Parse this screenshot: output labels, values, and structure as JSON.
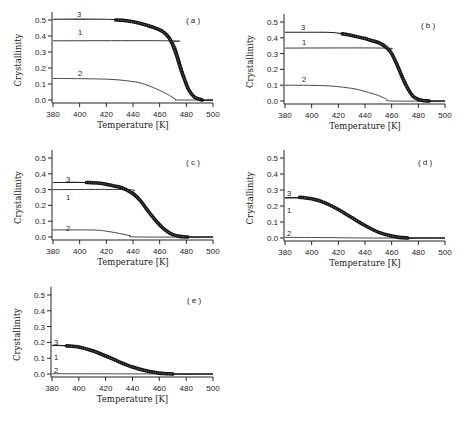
{
  "figure": {
    "xlabel": "Temperature [K]",
    "ylabel": "Crystallinity",
    "xticks": [
      "380",
      "400",
      "420",
      "440",
      "460",
      "480",
      "500"
    ],
    "yticks": [
      "0.0",
      "0.1",
      "0.2",
      "0.3",
      "0.4",
      "0.5"
    ]
  },
  "chart_data": [
    {
      "panel": "(a)",
      "type": "line",
      "xlabel": "Temperature [K]",
      "ylabel": "Crystallinity",
      "xlim": [
        380,
        500
      ],
      "ylim": [
        0,
        0.5
      ],
      "grid": false,
      "series": [
        {
          "name": "1",
          "x": [
            380,
            468,
            470,
            472,
            474,
            476,
            478,
            480,
            482,
            484,
            486,
            490,
            500
          ],
          "values": [
            0.37,
            0.37,
            0.36,
            0.33,
            0.28,
            0.22,
            0.16,
            0.1,
            0.06,
            0.03,
            0.01,
            0.0,
            0.0
          ]
        },
        {
          "name": "2",
          "x": [
            380,
            420,
            440,
            450,
            460,
            466,
            472,
            474,
            500
          ],
          "values": [
            0.135,
            0.13,
            0.115,
            0.095,
            0.06,
            0.035,
            0.005,
            0.0,
            0.0
          ]
        },
        {
          "name": "3",
          "x": [
            380,
            420,
            430,
            440,
            450,
            460,
            466,
            470,
            474,
            478,
            482,
            486,
            490,
            500
          ],
          "values": [
            0.505,
            0.505,
            0.5,
            0.485,
            0.465,
            0.435,
            0.4,
            0.35,
            0.27,
            0.16,
            0.07,
            0.02,
            0.0,
            0.0
          ]
        },
        {
          "name": "data",
          "style": "markers",
          "x": [
            427,
            435,
            445,
            455,
            462,
            467,
            470,
            473,
            476,
            479,
            482,
            486,
            490,
            492
          ],
          "values": [
            0.5,
            0.495,
            0.48,
            0.455,
            0.43,
            0.39,
            0.34,
            0.27,
            0.19,
            0.12,
            0.06,
            0.02,
            0.005,
            0.0
          ]
        }
      ]
    },
    {
      "panel": "(b)",
      "type": "line",
      "xlabel": "Temperature [K]",
      "ylabel": "Crystallinity",
      "xlim": [
        380,
        500
      ],
      "ylim": [
        0,
        0.5
      ],
      "grid": false,
      "series": [
        {
          "name": "1",
          "x": [
            380,
            454,
            458,
            462,
            466,
            470,
            474,
            478,
            482,
            500
          ],
          "values": [
            0.335,
            0.335,
            0.32,
            0.27,
            0.19,
            0.11,
            0.05,
            0.015,
            0.0,
            0.0
          ]
        },
        {
          "name": "2",
          "x": [
            380,
            410,
            430,
            440,
            450,
            456,
            460,
            500
          ],
          "values": [
            0.1,
            0.097,
            0.08,
            0.06,
            0.035,
            0.012,
            0.0,
            0.0
          ]
        },
        {
          "name": "3",
          "x": [
            380,
            410,
            420,
            430,
            440,
            450,
            456,
            460,
            464,
            468,
            472,
            476,
            480,
            488,
            500
          ],
          "values": [
            0.435,
            0.435,
            0.43,
            0.415,
            0.395,
            0.37,
            0.34,
            0.3,
            0.23,
            0.15,
            0.08,
            0.03,
            0.01,
            0.0,
            0.0
          ]
        },
        {
          "name": "data",
          "style": "markers",
          "x": [
            423,
            430,
            440,
            450,
            456,
            460,
            464,
            468,
            472,
            476,
            480,
            484,
            488
          ],
          "values": [
            0.425,
            0.415,
            0.395,
            0.37,
            0.34,
            0.3,
            0.23,
            0.15,
            0.08,
            0.03,
            0.01,
            0.002,
            0.0
          ]
        }
      ]
    },
    {
      "panel": "(c)",
      "type": "line",
      "xlabel": "Temperature [K]",
      "ylabel": "Crystallinity",
      "xlim": [
        380,
        500
      ],
      "ylim": [
        0,
        0.5
      ],
      "grid": false,
      "series": [
        {
          "name": "1",
          "x": [
            380,
            436,
            440,
            444,
            448,
            452,
            456,
            460,
            466,
            472,
            478,
            500
          ],
          "values": [
            0.3,
            0.3,
            0.285,
            0.255,
            0.21,
            0.16,
            0.11,
            0.07,
            0.03,
            0.01,
            0.0,
            0.0
          ]
        },
        {
          "name": "2",
          "x": [
            380,
            410,
            420,
            430,
            438,
            443,
            500
          ],
          "values": [
            0.045,
            0.044,
            0.037,
            0.022,
            0.008,
            0.0,
            0.0
          ]
        },
        {
          "name": "3",
          "x": [
            380,
            405,
            420,
            430,
            436,
            440,
            444,
            448,
            452,
            456,
            460,
            466,
            472,
            478,
            500
          ],
          "values": [
            0.345,
            0.345,
            0.335,
            0.315,
            0.295,
            0.275,
            0.245,
            0.205,
            0.16,
            0.11,
            0.07,
            0.03,
            0.01,
            0.0,
            0.0
          ]
        },
        {
          "name": "data",
          "style": "markers",
          "x": [
            405,
            415,
            425,
            432,
            438,
            442,
            446,
            450,
            454,
            458,
            462,
            466,
            470,
            474,
            478,
            481
          ],
          "values": [
            0.345,
            0.34,
            0.325,
            0.31,
            0.285,
            0.26,
            0.225,
            0.18,
            0.135,
            0.095,
            0.06,
            0.033,
            0.015,
            0.006,
            0.001,
            0.0
          ]
        }
      ]
    },
    {
      "panel": "(d)",
      "type": "line",
      "xlabel": "Temperature [K]",
      "ylabel": "Crystallinity",
      "xlim": [
        380,
        500
      ],
      "ylim": [
        0,
        0.5
      ],
      "grid": false,
      "series": [
        {
          "name": "1",
          "x": [
            380,
            390,
            400,
            410,
            420,
            430,
            440,
            450,
            460,
            470,
            480,
            500
          ],
          "values": [
            0.25,
            0.25,
            0.24,
            0.215,
            0.175,
            0.125,
            0.075,
            0.035,
            0.01,
            0.0,
            0.0,
            0.0
          ]
        },
        {
          "name": "2",
          "x": [
            380,
            400,
            420,
            440,
            500
          ],
          "values": [
            0.004,
            0.003,
            0.002,
            0.0,
            0.0
          ]
        },
        {
          "name": "3",
          "x": [
            380,
            390,
            400,
            410,
            420,
            430,
            440,
            450,
            460,
            470,
            480,
            500
          ],
          "values": [
            0.252,
            0.252,
            0.242,
            0.217,
            0.177,
            0.127,
            0.077,
            0.037,
            0.012,
            0.0,
            0.0,
            0.0
          ]
        },
        {
          "name": "data",
          "style": "markers",
          "x": [
            391,
            400,
            410,
            420,
            430,
            440,
            450,
            460,
            466,
            472
          ],
          "values": [
            0.255,
            0.245,
            0.22,
            0.178,
            0.128,
            0.078,
            0.037,
            0.012,
            0.004,
            0.0
          ]
        }
      ]
    },
    {
      "panel": "(e)",
      "type": "line",
      "xlabel": "Temperature [K]",
      "ylabel": "Crystallinity",
      "xlim": [
        380,
        500
      ],
      "ylim": [
        0,
        0.5
      ],
      "grid": false,
      "series": [
        {
          "name": "1",
          "x": [
            380,
            390,
            400,
            410,
            420,
            430,
            440,
            450,
            460,
            470,
            500
          ],
          "values": [
            0.18,
            0.178,
            0.168,
            0.145,
            0.112,
            0.075,
            0.042,
            0.018,
            0.005,
            0.0,
            0.0
          ]
        },
        {
          "name": "2",
          "x": [
            380,
            420,
            500
          ],
          "values": [
            0.002,
            0.001,
            0.0
          ]
        },
        {
          "name": "3",
          "x": [
            380,
            390,
            400,
            410,
            420,
            430,
            440,
            450,
            460,
            470,
            500
          ],
          "values": [
            0.182,
            0.18,
            0.17,
            0.147,
            0.114,
            0.077,
            0.044,
            0.02,
            0.006,
            0.0,
            0.0
          ]
        },
        {
          "name": "data",
          "style": "markers",
          "x": [
            391,
            400,
            410,
            420,
            430,
            440,
            450,
            460,
            465,
            470
          ],
          "values": [
            0.178,
            0.17,
            0.147,
            0.114,
            0.077,
            0.044,
            0.02,
            0.006,
            0.002,
            0.0
          ]
        }
      ]
    }
  ],
  "panels": [
    {
      "label": "( a )"
    },
    {
      "label": "( b )"
    },
    {
      "label": "( c )"
    },
    {
      "label": "( d )"
    },
    {
      "label": "( e )"
    }
  ],
  "curve_labels": {
    "one": "1",
    "two": "2",
    "three": "3"
  }
}
